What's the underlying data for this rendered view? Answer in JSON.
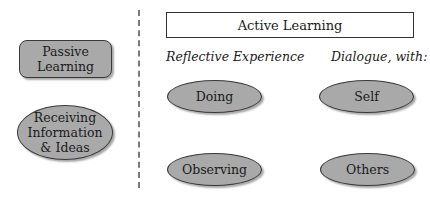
{
  "diagram": {
    "left": {
      "passive": {
        "label": "Passive\nLearning",
        "shape": "rounded-rectangle"
      },
      "receiving": {
        "label": "Receiving\nInformation\n& Ideas",
        "shape": "ellipse"
      }
    },
    "right": {
      "header": "Active Learning",
      "columns": [
        {
          "heading": "Reflective Experience",
          "items": [
            "Doing",
            "Observing"
          ]
        },
        {
          "heading": "Dialogue, with:",
          "items": [
            "Self",
            "Others"
          ]
        }
      ]
    },
    "colors": {
      "fill": "#a9a9a9",
      "border": "#3a3a3a",
      "divider": "#7a7a7a"
    }
  }
}
